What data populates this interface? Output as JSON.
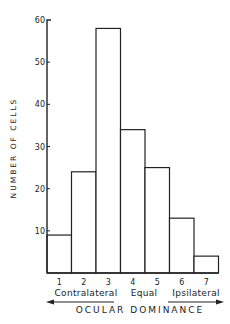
{
  "chart_data": {
    "type": "bar",
    "title": "",
    "ylabel": "NUMBER OF CELLS",
    "xlabel": "OCULAR DOMINANCE",
    "categories": [
      "1",
      "2",
      "3",
      "4",
      "5",
      "6",
      "7"
    ],
    "values": [
      9,
      24,
      58,
      34,
      25,
      13,
      4
    ],
    "ylim": [
      0,
      60
    ],
    "yticks": [
      10,
      20,
      30,
      40,
      50,
      60
    ],
    "ytick_labels": [
      "10",
      "20",
      "30",
      "40",
      "50",
      "60"
    ],
    "group_labels": {
      "left": "Contralateral",
      "middle": "Equal",
      "right": "Ipsilateral"
    },
    "arrows": [
      "left",
      "right"
    ],
    "grid": false,
    "legend": "none"
  }
}
